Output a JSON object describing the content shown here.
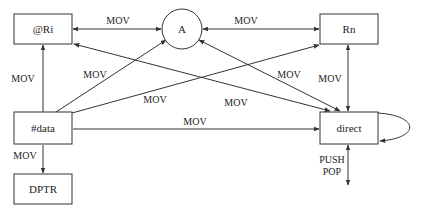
{
  "diagram": {
    "title": "",
    "nodes": {
      "ri": {
        "label": "@Ri"
      },
      "a": {
        "label": "A"
      },
      "rn": {
        "label": "Rn"
      },
      "data": {
        "label": "#data"
      },
      "direct": {
        "label": "direct"
      },
      "dptr": {
        "label": "DPTR"
      }
    },
    "edges": {
      "ri_a": "MOV",
      "a_rn": "MOV",
      "data_ri": "MOV",
      "data_a": "MOV",
      "data_rn": "MOV",
      "ri_direct": "MOV",
      "a_direct": "MOV",
      "rn_direct": "MOV",
      "data_direct": "MOV",
      "data_dptr": "MOV",
      "stack_push": "PUSH",
      "stack_pop": "POP"
    }
  }
}
